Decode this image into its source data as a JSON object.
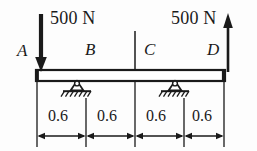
{
  "figure": {
    "beam": {
      "points": [
        "A",
        "B",
        "C",
        "D"
      ]
    },
    "loads": [
      {
        "id": "load-a",
        "label": "500 N",
        "direction": "down",
        "at": "A"
      },
      {
        "id": "load-d",
        "label": "500 N",
        "direction": "up",
        "at": "D"
      }
    ],
    "supports": [
      {
        "id": "support-b",
        "type": "pin",
        "at": "B"
      },
      {
        "id": "support-c",
        "type": "pin",
        "at": "C"
      }
    ],
    "point_labels": [
      {
        "id": "label-a",
        "text": "A"
      },
      {
        "id": "label-b",
        "text": "B"
      },
      {
        "id": "label-c",
        "text": "C"
      },
      {
        "id": "label-d",
        "text": "D"
      }
    ],
    "dimensions": [
      {
        "id": "dim-ab",
        "text": "0.6",
        "from": "A",
        "to": "B"
      },
      {
        "id": "dim-bmid",
        "text": "0.6",
        "from": "B",
        "to": "mid"
      },
      {
        "id": "dim-midc",
        "text": "0.6",
        "from": "mid",
        "to": "C"
      },
      {
        "id": "dim-cd",
        "text": "0.6",
        "from": "C",
        "to": "D"
      }
    ],
    "colors": {
      "ink": "#1a1a1a",
      "background": "#fdfdfd"
    }
  }
}
